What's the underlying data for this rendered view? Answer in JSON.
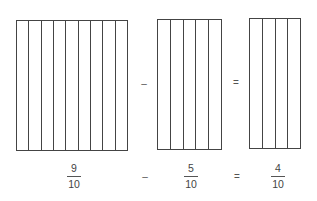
{
  "diagram": {
    "title": "",
    "bars": [
      {
        "id": "left",
        "columns": 9,
        "x": 16,
        "y": 20,
        "w": 112,
        "h": 131
      },
      {
        "id": "middle",
        "columns": 5,
        "x": 157,
        "y": 19,
        "w": 65,
        "h": 131
      },
      {
        "id": "right",
        "columns": 4,
        "x": 249,
        "y": 18,
        "w": 52,
        "h": 131
      }
    ],
    "operators_top": [
      {
        "symbol": "–",
        "x": 144,
        "y": 84
      },
      {
        "symbol": "=",
        "x": 236,
        "y": 83
      }
    ],
    "fractions": [
      {
        "numerator": "9",
        "denominator": "10",
        "x": 74
      },
      {
        "numerator": "5",
        "denominator": "10",
        "x": 191
      },
      {
        "numerator": "4",
        "denominator": "10",
        "x": 278
      }
    ],
    "operators_bottom": [
      {
        "symbol": "–",
        "x": 145,
        "y": 177
      },
      {
        "symbol": "=",
        "x": 237,
        "y": 177
      }
    ],
    "line_color": "#444444"
  }
}
